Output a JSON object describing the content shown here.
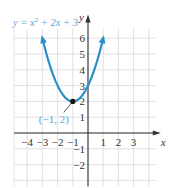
{
  "chart_data": {
    "type": "line",
    "title": "",
    "equation_label": "y = x² + 2x + 3",
    "xlabel": "x",
    "ylabel": "y",
    "xlim": [
      -5,
      4
    ],
    "ylim": [
      -3,
      7
    ],
    "x_ticks": [
      -4,
      -3,
      -2,
      -1,
      1,
      2,
      3
    ],
    "y_ticks": [
      -2,
      -1,
      1,
      2,
      3,
      4,
      5,
      6
    ],
    "grid": true,
    "series": [
      {
        "name": "y = x² + 2x + 3",
        "function": "x^2 + 2x + 3",
        "x": [
          -4,
          -3.5,
          -3,
          -2.5,
          -2,
          -1.5,
          -1,
          -0.5,
          0,
          0.5,
          1,
          1.5,
          2
        ],
        "values": [
          11,
          7.25,
          6,
          5.25,
          3,
          2.25,
          2,
          2.25,
          3,
          4.25,
          6,
          7.25,
          11
        ],
        "color": "#2a8fc9",
        "domain_shown": [
          -3,
          1
        ],
        "arrows_at_ends": true
      }
    ],
    "annotations": [
      {
        "label": "(−1, 2)",
        "x": -1,
        "y": 2,
        "type": "point",
        "color": "#2a8fc9"
      }
    ]
  },
  "colors": {
    "curve": "#2a8fc9",
    "grid": "#d9d9d9",
    "axis": "#333333",
    "label": "#5aa8d6"
  }
}
